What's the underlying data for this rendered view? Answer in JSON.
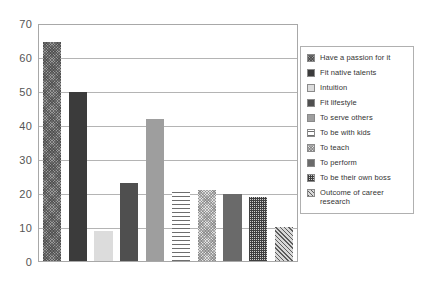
{
  "chart_data": {
    "type": "bar",
    "title": "",
    "xlabel": "",
    "ylabel": "",
    "ylim": [
      0,
      70
    ],
    "yticks": [
      0,
      10,
      20,
      30,
      40,
      50,
      60,
      70
    ],
    "grid": true,
    "legend_position": "right",
    "categories": [
      "Have a passion for it",
      "Fit native talents",
      "Intuition",
      "Fit lifestyle",
      "To serve others",
      "To be with kids",
      "To teach",
      "To perform",
      "To be their own boss",
      "Outcome of career research"
    ],
    "values": [
      65,
      50,
      9,
      23,
      42,
      21,
      21,
      20,
      19,
      10
    ],
    "series": [
      {
        "name": "Reasons",
        "values": [
          65,
          50,
          9,
          23,
          42,
          21,
          21,
          20,
          19,
          10
        ]
      }
    ]
  },
  "legend": {
    "items": [
      {
        "label": "Have a passion for it",
        "pattern": "p-passion"
      },
      {
        "label": "Fit native talents",
        "pattern": "p-native"
      },
      {
        "label": "Intuition",
        "pattern": "p-intuition"
      },
      {
        "label": "Fit lifestyle",
        "pattern": "p-lifestyle"
      },
      {
        "label": "To serve others",
        "pattern": "p-serve"
      },
      {
        "label": "To be with kids",
        "pattern": "p-kids"
      },
      {
        "label": "To teach",
        "pattern": "p-teach"
      },
      {
        "label": "To perform",
        "pattern": "p-perform"
      },
      {
        "label": "To be their own boss",
        "pattern": "p-boss"
      },
      {
        "label": "Outcome of career research",
        "pattern": "p-outcome"
      }
    ]
  },
  "axis": {
    "tick_labels": [
      "0",
      "10",
      "20",
      "30",
      "40",
      "50",
      "60",
      "70"
    ]
  },
  "colors": {
    "frame": "#a8a8a8",
    "gridline": "#b4b4b4",
    "text": "#555555",
    "background": "#ffffff"
  }
}
